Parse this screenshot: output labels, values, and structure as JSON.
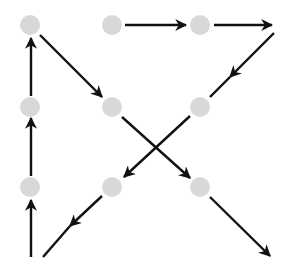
{
  "diagram": {
    "title": "",
    "colors": {
      "dot": "#d8d8d8",
      "line": "#111111",
      "background": "#ffffff"
    },
    "dots": [
      {
        "id": "r1c1",
        "x": 30,
        "y": 25
      },
      {
        "id": "r1c2",
        "x": 112,
        "y": 25
      },
      {
        "id": "r1c3",
        "x": 200,
        "y": 25
      },
      {
        "id": "r2c1",
        "x": 30,
        "y": 107
      },
      {
        "id": "r2c2",
        "x": 112,
        "y": 107
      },
      {
        "id": "r2c3",
        "x": 200,
        "y": 107
      },
      {
        "id": "r3c1",
        "x": 30,
        "y": 187
      },
      {
        "id": "r3c2",
        "x": 112,
        "y": 187
      },
      {
        "id": "r3c3",
        "x": 200,
        "y": 187
      }
    ],
    "segments": [
      {
        "from": [
          31,
          257
        ],
        "to": [
          31,
          200
        ],
        "arrow": true
      },
      {
        "from": [
          31,
          176
        ],
        "to": [
          31,
          118
        ],
        "arrow": true
      },
      {
        "from": [
          31,
          96
        ],
        "to": [
          31,
          38
        ],
        "arrow": true
      },
      {
        "from": [
          40,
          35
        ],
        "to": [
          102,
          97
        ],
        "arrow": true
      },
      {
        "from": [
          122,
          117
        ],
        "to": [
          190,
          178
        ],
        "arrow": true
      },
      {
        "from": [
          210,
          197
        ],
        "to": [
          270,
          256
        ],
        "arrow": true
      },
      {
        "from": [
          125,
          25
        ],
        "to": [
          186,
          25
        ],
        "arrow": true
      },
      {
        "from": [
          214,
          25
        ],
        "to": [
          272,
          25
        ],
        "arrow": true
      },
      {
        "from": [
          274,
          33
        ],
        "to": [
          230,
          77
        ],
        "arrow": true
      },
      {
        "from": [
          230,
          77
        ],
        "to": [
          210,
          97
        ],
        "arrow": false
      },
      {
        "from": [
          190,
          116
        ],
        "to": [
          124,
          177
        ],
        "arrow": true
      },
      {
        "from": [
          102,
          196
        ],
        "to": [
          70,
          226
        ],
        "arrow": true
      },
      {
        "from": [
          70,
          226
        ],
        "to": [
          43,
          257
        ],
        "arrow": false
      }
    ]
  }
}
